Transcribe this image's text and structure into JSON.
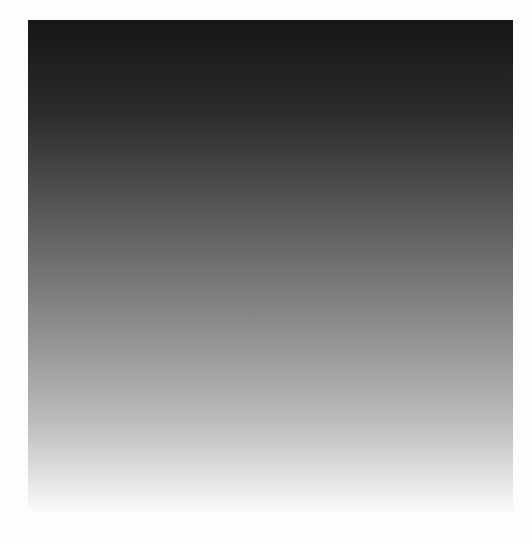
{
  "gradient": {
    "direction": "to bottom",
    "stops": [
      {
        "color": "#161616",
        "pos": "0%"
      },
      {
        "color": "#2a2a2a",
        "pos": "18%"
      },
      {
        "color": "#5a5a5a",
        "pos": "40%"
      },
      {
        "color": "#8c8c8c",
        "pos": "62%"
      },
      {
        "color": "#bdbdbd",
        "pos": "82%"
      },
      {
        "color": "#e6e6e6",
        "pos": "94%"
      },
      {
        "color": "#fbfbfb",
        "pos": "100%"
      }
    ]
  }
}
